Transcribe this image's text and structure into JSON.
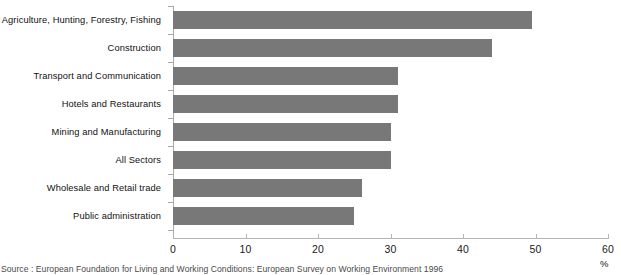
{
  "chart_data": {
    "type": "bar",
    "orientation": "horizontal",
    "title": "",
    "subtitle": "",
    "xlabel": "%",
    "ylabel": "",
    "xlim": [
      0,
      60
    ],
    "x_ticks": [
      0,
      10,
      20,
      30,
      40,
      50,
      60
    ],
    "grid": false,
    "legend": null,
    "categories": [
      "Agriculture, Hunting, Forestry, Fishing",
      "Construction",
      "Transport and Communication",
      "Hotels and Restaurants",
      "Mining and Manufacturing",
      "All Sectors",
      "Wholesale and Retail trade",
      "Public administration"
    ],
    "values": [
      49.5,
      44,
      31,
      31,
      30,
      30,
      26,
      25
    ],
    "bar_color": "#787878",
    "axis_color": "#b4b4b4",
    "source": "Source : European Foundation for Living and Working Conditions: European Survey on Working Environment 1996"
  }
}
